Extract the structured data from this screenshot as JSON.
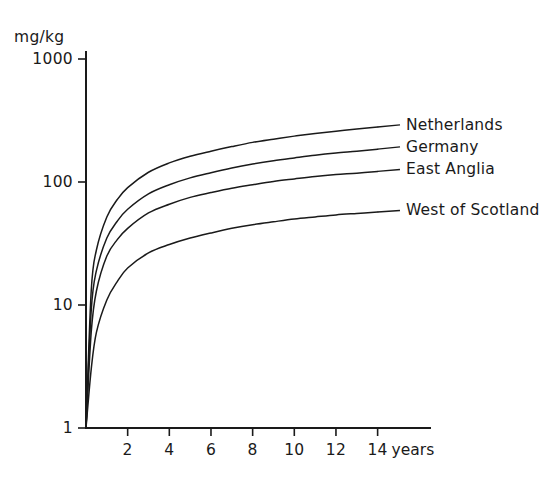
{
  "chart_data": {
    "type": "line",
    "title": "",
    "subtitle": "",
    "xlabel": "years",
    "ylabel": "mg/kg",
    "yscale": "log",
    "xscale": "linear",
    "xlim": [
      0,
      15.5
    ],
    "ylim": [
      1,
      1000
    ],
    "grid": false,
    "legend_position": "right-inline-end-labels",
    "y_tick_labels": [
      "1000",
      "100",
      "10",
      "1"
    ],
    "y_tick_values": [
      1000,
      100,
      10,
      1
    ],
    "x_tick_labels": [
      "2",
      "4",
      "6",
      "8",
      "10",
      "12",
      "14"
    ],
    "x_tick_values": [
      2,
      4,
      6,
      8,
      10,
      12,
      14
    ],
    "x": [
      0,
      0.25,
      0.5,
      1,
      1.5,
      2,
      3,
      4,
      5,
      6,
      7,
      8,
      9,
      10,
      11,
      12,
      13,
      14
    ],
    "series": [
      {
        "name": "Netherlands",
        "values": [
          1,
          13,
          28,
          52,
          72,
          90,
          120,
          143,
          162,
          178,
          194,
          210,
          223,
          236,
          248,
          259,
          270,
          280
        ]
      },
      {
        "name": "Germany",
        "values": [
          1,
          9,
          19,
          35,
          48,
          60,
          80,
          95,
          108,
          119,
          130,
          140,
          149,
          157,
          165,
          172,
          178,
          185
        ]
      },
      {
        "name": "East Anglia",
        "values": [
          1,
          6,
          13,
          25,
          34,
          42,
          56,
          66,
          75,
          82,
          89,
          95,
          101,
          106,
          111,
          115,
          118,
          122
        ]
      },
      {
        "name": "West of Scotland",
        "values": [
          1,
          3,
          6,
          11,
          15.5,
          20,
          26.5,
          31,
          35,
          38.5,
          42,
          45,
          47.5,
          50,
          52,
          54,
          55.5,
          57
        ]
      }
    ]
  },
  "axis": {
    "y_unit": "mg/kg",
    "x_unit": "years"
  }
}
